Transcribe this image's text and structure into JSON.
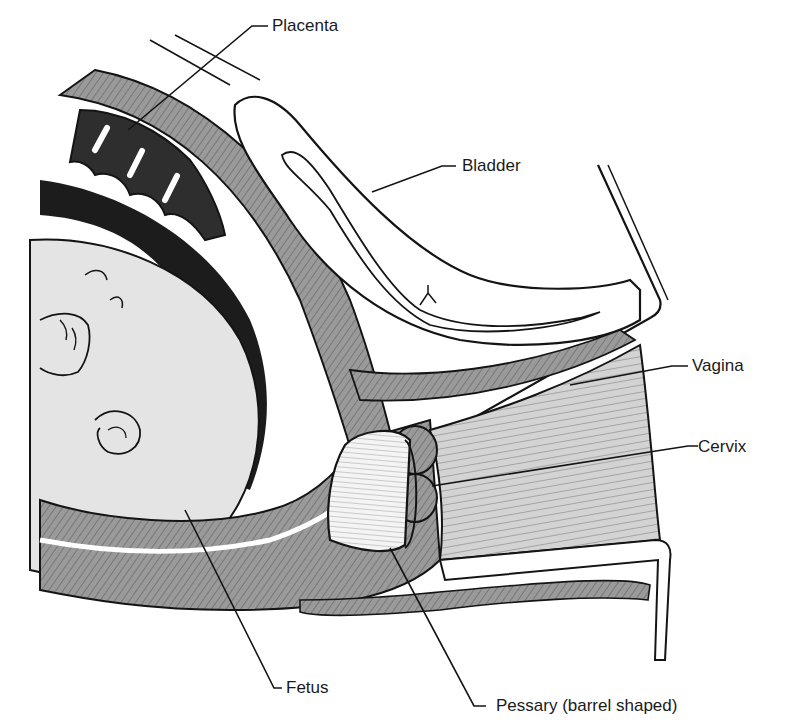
{
  "diagram": {
    "colors": {
      "background": "#ffffff",
      "outline": "#141414",
      "muscle": "#8f8f8f",
      "muscle_light": "#b5b5b5",
      "placenta": "#2e2e2e",
      "amniotic_dark": "#1c1c1c",
      "fetus_skin": "#e4e4e4",
      "vaginal_wall": "#cfcfcf",
      "pessary": "#f2f2f2"
    },
    "labels": {
      "placenta": "Placenta",
      "bladder": "Bladder",
      "vagina": "Vagina",
      "cervix": "Cervix",
      "fetus": "Fetus",
      "pessary": "Pessary (barrel shaped)"
    }
  }
}
